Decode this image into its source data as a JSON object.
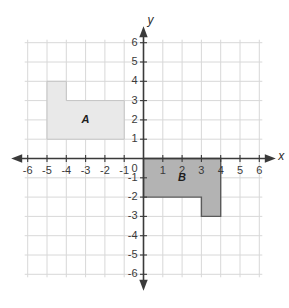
{
  "figure": {
    "background_color": "#ffffff"
  },
  "axes": {
    "x_axis_label": "x",
    "y_axis_label": "y",
    "x_min": -6,
    "x_max": 6,
    "y_min": -6,
    "y_max": 6,
    "origin_label": "0",
    "axis_color": "#3a3a3a",
    "grid_color": "#d8d8d8",
    "grid_visible": true,
    "arrowheads": "both-ends",
    "x_tick_labels": [
      "-6",
      "-5",
      "-4",
      "-3",
      "-2",
      "-1",
      "0",
      "1",
      "2",
      "3",
      "4",
      "5",
      "6"
    ],
    "y_tick_labels": [
      "6",
      "5",
      "4",
      "3",
      "2",
      "1",
      "0",
      "-1",
      "-2",
      "-3",
      "-4",
      "-5",
      "-6"
    ],
    "x_tick_values": [
      -6,
      -5,
      -4,
      -3,
      -2,
      -1,
      0,
      1,
      2,
      3,
      4,
      5,
      6
    ],
    "y_tick_values": [
      6,
      5,
      4,
      3,
      2,
      1,
      0,
      -1,
      -2,
      -3,
      -4,
      -5,
      -6
    ]
  },
  "shapes": [
    {
      "name": "A",
      "label": "A",
      "label_position": {
        "x": -3,
        "y": 2
      },
      "fill_color": "#e9e9e9",
      "stroke_color": "#c4c4c4",
      "stroke_width": 1,
      "quadrant": "second",
      "vertices": [
        {
          "x": -5,
          "y": 4
        },
        {
          "x": -4,
          "y": 4
        },
        {
          "x": -4,
          "y": 3
        },
        {
          "x": -1,
          "y": 3
        },
        {
          "x": -1,
          "y": 1
        },
        {
          "x": -5,
          "y": 1
        }
      ],
      "description": "L-shaped hexagon: 4x2 rectangle from (-5,1) to (-1,3) with a 1x1 tab on top-left from (-5,3) to (-4,4)"
    },
    {
      "name": "B",
      "label": "B",
      "label_position": {
        "x": 2,
        "y": -1
      },
      "fill_color": "#b3b3b3",
      "stroke_color": "#5a5a5a",
      "stroke_width": 1.4,
      "quadrant": "fourth",
      "vertices": [
        {
          "x": 0,
          "y": 0
        },
        {
          "x": 4,
          "y": 0
        },
        {
          "x": 4,
          "y": -3
        },
        {
          "x": 3,
          "y": -3
        },
        {
          "x": 3,
          "y": -2
        },
        {
          "x": 0,
          "y": -2
        }
      ],
      "description": "L-shaped hexagon: 4x2 rectangle from (0,-2) to (4,0) with a 1x1 tab below on the right from (3,-3) to (4,-2)"
    }
  ]
}
